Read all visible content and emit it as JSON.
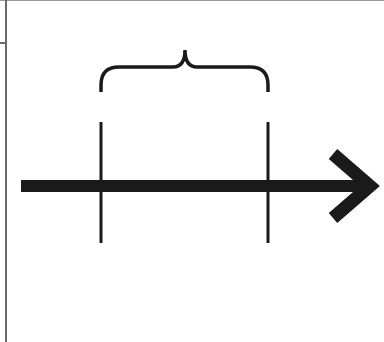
{
  "diagram": {
    "type": "timeline-interval",
    "background": "#ffffff",
    "stroke_color": "#1a1a1a",
    "frame_color": "#6a6a6a",
    "arrow": {
      "direction": "right",
      "shaft": {
        "x1": 21,
        "x2": 360,
        "y": 186,
        "thickness": 12
      },
      "head_tip": {
        "x": 377,
        "y": 186
      },
      "head_arms": [
        {
          "x": 333,
          "y": 154
        },
        {
          "x": 333,
          "y": 218
        }
      ]
    },
    "markers": [
      {
        "name": "interval-start",
        "x": 101,
        "y1": 122,
        "y2": 243
      },
      {
        "name": "interval-end",
        "x": 268,
        "y1": 122,
        "y2": 243
      }
    ],
    "brace": {
      "x1": 101,
      "x2": 268,
      "baseline_y": 92,
      "top_y": 67,
      "peak": {
        "x": 185,
        "y": 50
      }
    }
  }
}
